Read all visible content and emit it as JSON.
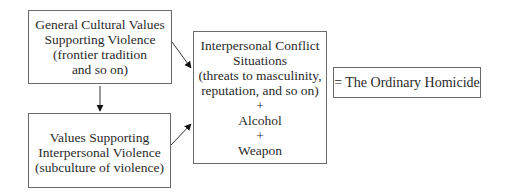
{
  "diagram": {
    "boxes": {
      "general": {
        "lines": [
          "General Cultural Values",
          "Supporting Violence",
          "(frontier tradition",
          "and so on)"
        ]
      },
      "values": {
        "lines": [
          "Values Supporting",
          "Interpersonal Violence",
          "(subculture of violence)"
        ]
      },
      "conflict": {
        "lines": [
          "Interpersonal Conflict",
          "Situations",
          "(threats to masculinity,",
          "reputation, and so on)",
          "+",
          "Alcohol",
          "+",
          "Weapon"
        ]
      },
      "result": {
        "lines": [
          "= The Ordinary Homicide"
        ]
      }
    },
    "arrows": [
      {
        "from": "general",
        "to": "values"
      },
      {
        "from": "general",
        "to": "conflict"
      },
      {
        "from": "values",
        "to": "conflict"
      }
    ],
    "colors": {
      "line": "#6a6a6a",
      "text": "#2a2a2a",
      "arrow": "#111111"
    }
  }
}
